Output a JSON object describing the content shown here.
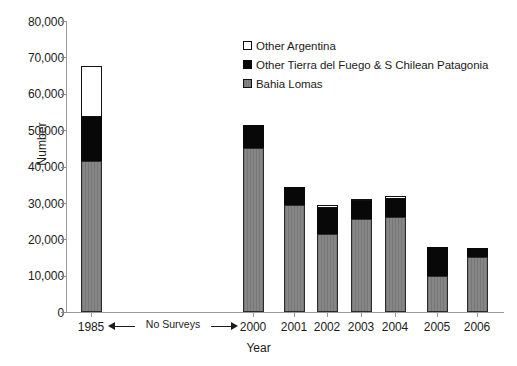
{
  "chart_data": {
    "type": "bar",
    "stacked": true,
    "title": "",
    "xlabel": "Year",
    "ylabel": "Number",
    "ylim": [
      0,
      80000
    ],
    "ytick_labels": [
      "80,000",
      "70,000",
      "60,000",
      "50,000",
      "40,000",
      "30,000",
      "20,000",
      "10,000",
      "0"
    ],
    "ytick_values": [
      80000,
      70000,
      60000,
      50000,
      40000,
      30000,
      20000,
      10000,
      0
    ],
    "grid": false,
    "legend_position": "upper-center",
    "categories": [
      "1985",
      "2000",
      "2001",
      "2002",
      "2003",
      "2004",
      "2005",
      "2006"
    ],
    "series": [
      {
        "name": "Bahia Lomas",
        "color": "#808080",
        "values": [
          41500,
          45000,
          29500,
          21500,
          25500,
          26000,
          10000,
          15000
        ]
      },
      {
        "name": "Other Tierra del Fuego & S Chilean Patagonia",
        "color": "#080808",
        "values": [
          12000,
          6500,
          5000,
          7000,
          5000,
          5000,
          8000,
          2500
        ]
      },
      {
        "name": "Other Argentina",
        "color": "#ffffff",
        "values": [
          14000,
          0,
          0,
          1000,
          500,
          1000,
          0,
          0
        ]
      }
    ],
    "totals": [
      67500,
      51500,
      34500,
      29500,
      31000,
      32000,
      18000,
      17500
    ],
    "annotations": [
      {
        "name": "no-surveys",
        "text": "No Surveys",
        "from_category": "1985",
        "to_category": "2000",
        "style": "double-headed-arrow"
      }
    ]
  },
  "legend": {
    "items": [
      {
        "label": "Other Argentina",
        "swatch": "white-square-icon"
      },
      {
        "label": "Other Tierra del Fuego & S Chilean Patagonia",
        "swatch": "black-square-icon"
      },
      {
        "label": "Bahia Lomas",
        "swatch": "gray-square-icon"
      }
    ]
  }
}
